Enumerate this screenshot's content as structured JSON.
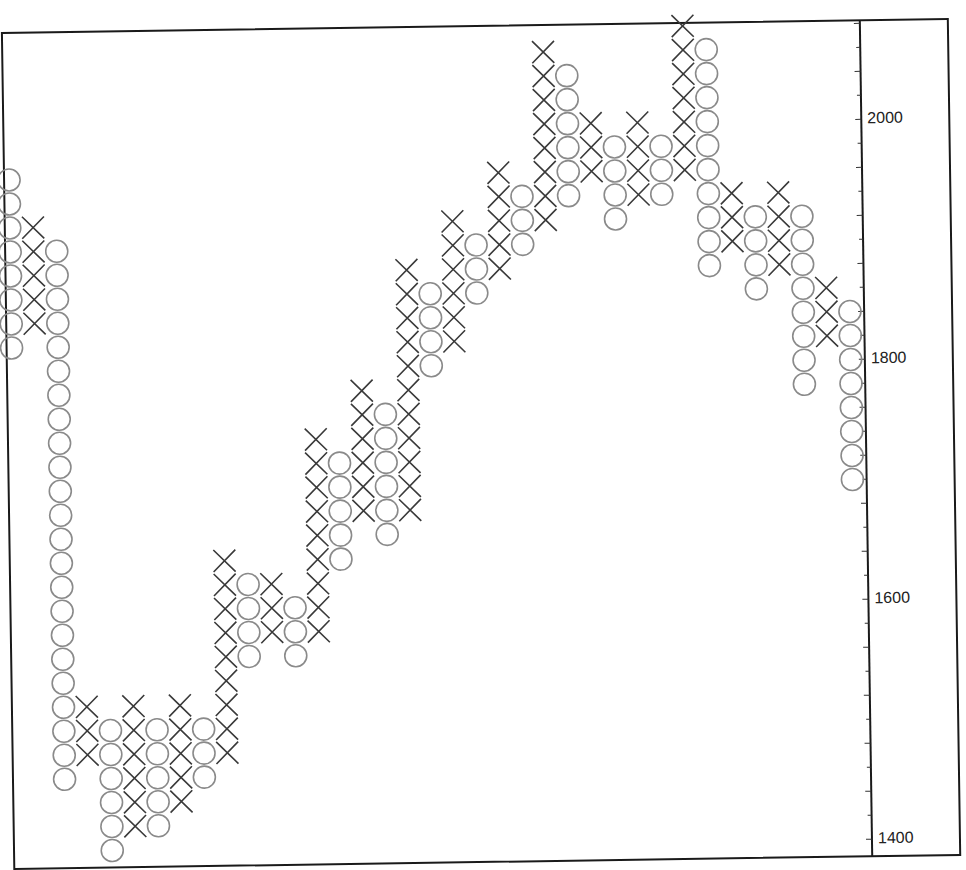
{
  "chart_data": {
    "type": "point_and_figure",
    "title": "",
    "xlabel": "",
    "ylabel": "",
    "box_size": 20,
    "ylim": [
      1380,
      2080
    ],
    "y_ticks": [
      1400,
      1600,
      1800,
      2000
    ],
    "y_tick_labels": [
      "1400",
      "1600",
      "1800",
      "2000"
    ],
    "minor_tick_step": 20,
    "major_tick_step": 40,
    "grid": false,
    "legend": null,
    "columns": [
      {
        "type": "O",
        "high": 1960,
        "low": 1820
      },
      {
        "type": "X",
        "high": 1920,
        "low": 1840
      },
      {
        "type": "O",
        "high": 1900,
        "low": 1460
      },
      {
        "type": "X",
        "high": 1520,
        "low": 1480
      },
      {
        "type": "O",
        "high": 1500,
        "low": 1400
      },
      {
        "type": "X",
        "high": 1520,
        "low": 1420
      },
      {
        "type": "O",
        "high": 1500,
        "low": 1420
      },
      {
        "type": "X",
        "high": 1520,
        "low": 1440
      },
      {
        "type": "O",
        "high": 1500,
        "low": 1460
      },
      {
        "type": "X",
        "high": 1640,
        "low": 1480
      },
      {
        "type": "O",
        "high": 1620,
        "low": 1560
      },
      {
        "type": "X",
        "high": 1620,
        "low": 1580
      },
      {
        "type": "O",
        "high": 1600,
        "low": 1560
      },
      {
        "type": "X",
        "high": 1740,
        "low": 1580
      },
      {
        "type": "O",
        "high": 1720,
        "low": 1640
      },
      {
        "type": "X",
        "high": 1780,
        "low": 1680
      },
      {
        "type": "O",
        "high": 1760,
        "low": 1660
      },
      {
        "type": "X",
        "high": 1880,
        "low": 1680
      },
      {
        "type": "O",
        "high": 1860,
        "low": 1800
      },
      {
        "type": "X",
        "high": 1920,
        "low": 1820
      },
      {
        "type": "O",
        "high": 1900,
        "low": 1860
      },
      {
        "type": "X",
        "high": 1960,
        "low": 1880
      },
      {
        "type": "O",
        "high": 1940,
        "low": 1900
      },
      {
        "type": "X",
        "high": 2060,
        "low": 1920
      },
      {
        "type": "O",
        "high": 2040,
        "low": 1940
      },
      {
        "type": "X",
        "high": 2000,
        "low": 1960
      },
      {
        "type": "O",
        "high": 1980,
        "low": 1920
      },
      {
        "type": "X",
        "high": 2000,
        "low": 1940
      },
      {
        "type": "O",
        "high": 1980,
        "low": 1940
      },
      {
        "type": "X",
        "high": 2080,
        "low": 1960
      },
      {
        "type": "O",
        "high": 2060,
        "low": 1880
      },
      {
        "type": "X",
        "high": 1940,
        "low": 1900
      },
      {
        "type": "O",
        "high": 1920,
        "low": 1860
      },
      {
        "type": "X",
        "high": 1940,
        "low": 1880
      },
      {
        "type": "O",
        "high": 1920,
        "low": 1780
      },
      {
        "type": "X",
        "high": 1860,
        "low": 1820
      },
      {
        "type": "O",
        "high": 1840,
        "low": 1700
      }
    ]
  },
  "style": {
    "x_color": "#3a3a3a",
    "o_color": "#8a8a8a",
    "frame_color": "#1a1a1a",
    "background": "#ffffff"
  },
  "axis": {
    "labels": {
      "y2000": "2000",
      "y1800": "1800",
      "y1600": "1600",
      "y1400": "1400"
    }
  }
}
